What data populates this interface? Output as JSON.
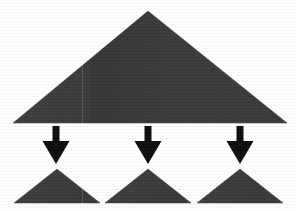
{
  "figure": {
    "description": "One large triangle above, three downward arrows, three smaller triangles below",
    "background_color": "#ffffff",
    "width": 296,
    "height": 211
  },
  "colors": {
    "triangle_fill": "#3b3b3b",
    "triangle_fill_shade": "#333333",
    "arrow_fill": "#0d0d0d",
    "background": "#ffffff"
  },
  "shapes": {
    "parent_triangle": {
      "label": "large-triangle",
      "apex_x": 148,
      "apex_y": 11,
      "left_x": 13,
      "right_x": 287,
      "base_y": 123,
      "points": "148,11 287,123 13,123"
    },
    "arrows": [
      {
        "label": "arrow-left",
        "center_x": 56,
        "top_y": 126,
        "tip_y": 164,
        "shaft_width": 7,
        "head_width": 27,
        "head_top_y": 141,
        "points": "52.5,126 59.5,126 59.5,141 69.5,141 56,164 42.5,141 52.5,141"
      },
      {
        "label": "arrow-center",
        "center_x": 148,
        "top_y": 126,
        "tip_y": 164,
        "shaft_width": 7,
        "head_width": 27,
        "head_top_y": 141,
        "points": "144.5,126 151.5,126 151.5,141 161.5,141 148,164 134.5,141 144.5,141"
      },
      {
        "label": "arrow-right",
        "center_x": 240,
        "top_y": 126,
        "tip_y": 164,
        "shaft_width": 7,
        "head_width": 27,
        "head_top_y": 141,
        "points": "236.5,126 243.5,126 243.5,141 253.5,141 240,164 226.5,141 236.5,141"
      }
    ],
    "child_triangles": [
      {
        "label": "small-triangle-1",
        "apex_x": 57,
        "apex_y": 169,
        "left_x": 14,
        "right_x": 100,
        "base_y": 203,
        "points": "57,169 100,203 14,203"
      },
      {
        "label": "small-triangle-2",
        "apex_x": 148,
        "apex_y": 169,
        "left_x": 105,
        "right_x": 191,
        "base_y": 203,
        "points": "148,169 191,203 105,203"
      },
      {
        "label": "small-triangle-3",
        "apex_x": 240,
        "apex_y": 169,
        "left_x": 197,
        "right_x": 283,
        "base_y": 203,
        "points": "240,169 283,203 197,203"
      }
    ],
    "seam_artifacts": [
      {
        "label": "seam-left",
        "x": 82,
        "top": 11,
        "height": 112
      },
      {
        "label": "seam-bottom",
        "x": 82,
        "top": 169,
        "height": 34
      }
    ]
  }
}
